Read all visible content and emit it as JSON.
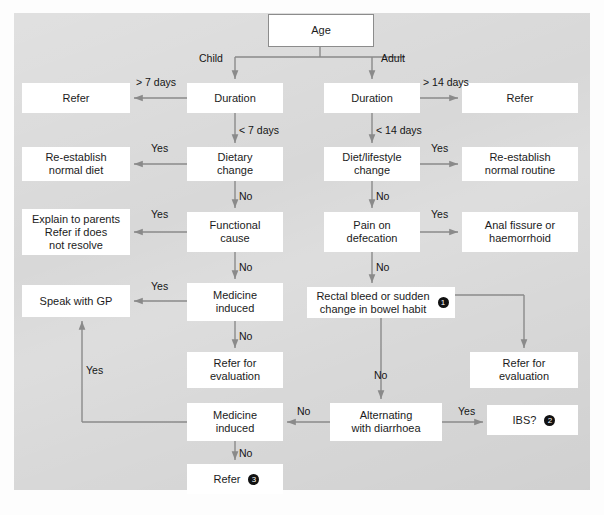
{
  "figure": {
    "type": "clinical-decision-flowchart",
    "panel": {
      "x": 14,
      "y": 13,
      "w": 576,
      "h": 477,
      "bg": "#d8d8d8"
    },
    "caption": "",
    "colors": {
      "box_fill": "#ffffff",
      "box_border": "#8c8c8c",
      "arrow": "#8a8a8a",
      "text": "#1b1b1b",
      "panel_bg": "#d8d8d8"
    }
  },
  "nodes": [
    {
      "id": "age",
      "label": "Age",
      "x": 268,
      "y": 14,
      "w": 104,
      "h": 31,
      "bordered": true,
      "marker": null
    },
    {
      "id": "refer_child",
      "label": "Refer",
      "x": 22,
      "y": 83,
      "w": 108,
      "h": 30,
      "bordered": false,
      "marker": null
    },
    {
      "id": "duration_child",
      "label": "Duration",
      "x": 187,
      "y": 83,
      "w": 96,
      "h": 30,
      "bordered": false,
      "marker": null
    },
    {
      "id": "duration_adult",
      "label": "Duration",
      "x": 324,
      "y": 83,
      "w": 96,
      "h": 30,
      "bordered": false,
      "marker": null
    },
    {
      "id": "refer_adult",
      "label": "Refer",
      "x": 462,
      "y": 83,
      "w": 116,
      "h": 30,
      "bordered": false,
      "marker": null
    },
    {
      "id": "reestablish_diet",
      "label": "Re-establish\nnormal diet",
      "x": 22,
      "y": 147,
      "w": 108,
      "h": 34,
      "bordered": false,
      "marker": null
    },
    {
      "id": "dietary_change",
      "label": "Dietary\nchange",
      "x": 187,
      "y": 147,
      "w": 96,
      "h": 34,
      "bordered": false,
      "marker": null
    },
    {
      "id": "diet_lifestyle",
      "label": "Diet/lifestyle\nchange",
      "x": 324,
      "y": 147,
      "w": 96,
      "h": 34,
      "bordered": false,
      "marker": null
    },
    {
      "id": "reestablish_routine",
      "label": "Re-establish\nnormal routine",
      "x": 462,
      "y": 147,
      "w": 116,
      "h": 34,
      "bordered": false,
      "marker": null
    },
    {
      "id": "explain_parents",
      "label": "Explain to parents\nRefer if does\nnot resolve",
      "x": 22,
      "y": 209,
      "w": 108,
      "h": 46,
      "bordered": false,
      "marker": null
    },
    {
      "id": "functional_cause",
      "label": "Functional\ncause",
      "x": 187,
      "y": 212,
      "w": 96,
      "h": 40,
      "bordered": false,
      "marker": null
    },
    {
      "id": "pain_defecation",
      "label": "Pain on\ndefecation",
      "x": 324,
      "y": 212,
      "w": 96,
      "h": 40,
      "bordered": false,
      "marker": null
    },
    {
      "id": "anal_fissure",
      "label": "Anal fissure or\nhaemorrhoid",
      "x": 462,
      "y": 212,
      "w": 116,
      "h": 40,
      "bordered": false,
      "marker": null
    },
    {
      "id": "speak_gp",
      "label": "Speak with GP",
      "x": 22,
      "y": 285,
      "w": 108,
      "h": 32,
      "bordered": false,
      "marker": null
    },
    {
      "id": "medicine_induced_1",
      "label": "Medicine\ninduced",
      "x": 187,
      "y": 283,
      "w": 96,
      "h": 38,
      "bordered": false,
      "marker": null
    },
    {
      "id": "rectal_bleed",
      "label": "Rectal bleed or sudden\nchange in bowel habit",
      "x": 307,
      "y": 287,
      "w": 148,
      "h": 31,
      "bordered": false,
      "marker": "1"
    },
    {
      "id": "refer_eval_left",
      "label": "Refer for\nevaluation",
      "x": 187,
      "y": 352,
      "w": 96,
      "h": 36,
      "bordered": false,
      "marker": null
    },
    {
      "id": "refer_eval_right",
      "label": "Refer for\nevaluation",
      "x": 470,
      "y": 352,
      "w": 108,
      "h": 36,
      "bordered": false,
      "marker": null
    },
    {
      "id": "medicine_induced_2",
      "label": "Medicine\ninduced",
      "x": 187,
      "y": 403,
      "w": 96,
      "h": 38,
      "bordered": false,
      "marker": null
    },
    {
      "id": "alternating_diarrhoea",
      "label": "Alternating\nwith diarrhoea",
      "x": 330,
      "y": 403,
      "w": 112,
      "h": 38,
      "bordered": false,
      "marker": null
    },
    {
      "id": "ibs",
      "label": "IBS?",
      "x": 487,
      "y": 405,
      "w": 91,
      "h": 30,
      "bordered": false,
      "marker": "2"
    },
    {
      "id": "refer_final",
      "label": "Refer",
      "x": 187,
      "y": 464,
      "w": 96,
      "h": 30,
      "bordered": false,
      "marker": "3"
    }
  ],
  "edge_labels": [
    {
      "id": "child",
      "text": "Child",
      "x": 199,
      "y": 52
    },
    {
      "id": "adult",
      "text": "Adult",
      "x": 381,
      "y": 52
    },
    {
      "id": "gt7days",
      "text": "> 7 days",
      "x": 136,
      "y": 76
    },
    {
      "id": "lt7days",
      "text": "< 7 days",
      "x": 239,
      "y": 124
    },
    {
      "id": "gt14days",
      "text": "> 14 days",
      "x": 423,
      "y": 76
    },
    {
      "id": "lt14days",
      "text": "< 14 days",
      "x": 376,
      "y": 124
    },
    {
      "id": "yes_diet_child",
      "text": "Yes",
      "x": 151,
      "y": 142
    },
    {
      "id": "no_diet_child",
      "text": "No",
      "x": 239,
      "y": 190
    },
    {
      "id": "yes_diet_adult",
      "text": "Yes",
      "x": 431,
      "y": 142
    },
    {
      "id": "no_diet_adult",
      "text": "No",
      "x": 376,
      "y": 190
    },
    {
      "id": "yes_functional",
      "text": "Yes",
      "x": 151,
      "y": 208
    },
    {
      "id": "no_functional",
      "text": "No",
      "x": 239,
      "y": 261
    },
    {
      "id": "yes_pain",
      "text": "Yes",
      "x": 431,
      "y": 208
    },
    {
      "id": "no_pain",
      "text": "No",
      "x": 376,
      "y": 261
    },
    {
      "id": "yes_medicine1",
      "text": "Yes",
      "x": 151,
      "y": 280
    },
    {
      "id": "no_medicine1",
      "text": "No",
      "x": 239,
      "y": 330
    },
    {
      "id": "no_rectal",
      "text": "No",
      "x": 374,
      "y": 369
    },
    {
      "id": "yes_long",
      "text": "Yes",
      "x": 86,
      "y": 364
    },
    {
      "id": "no_alternating",
      "text": "No",
      "x": 297,
      "y": 405
    },
    {
      "id": "yes_alternating",
      "text": "Yes",
      "x": 458,
      "y": 405
    },
    {
      "id": "no_medicine2",
      "text": "No",
      "x": 239,
      "y": 447
    }
  ],
  "edges": [
    {
      "from": "age",
      "to": "duration_child",
      "label": "Child"
    },
    {
      "from": "age",
      "to": "duration_adult",
      "label": "Adult"
    },
    {
      "from": "duration_child",
      "to": "refer_child",
      "label": "> 7 days"
    },
    {
      "from": "duration_child",
      "to": "dietary_change",
      "label": "< 7 days"
    },
    {
      "from": "duration_adult",
      "to": "refer_adult",
      "label": "> 14 days"
    },
    {
      "from": "duration_adult",
      "to": "diet_lifestyle",
      "label": "< 14 days"
    },
    {
      "from": "dietary_change",
      "to": "reestablish_diet",
      "label": "Yes"
    },
    {
      "from": "dietary_change",
      "to": "functional_cause",
      "label": "No"
    },
    {
      "from": "diet_lifestyle",
      "to": "reestablish_routine",
      "label": "Yes"
    },
    {
      "from": "diet_lifestyle",
      "to": "pain_defecation",
      "label": "No"
    },
    {
      "from": "functional_cause",
      "to": "explain_parents",
      "label": "Yes"
    },
    {
      "from": "functional_cause",
      "to": "medicine_induced_1",
      "label": "No"
    },
    {
      "from": "pain_defecation",
      "to": "anal_fissure",
      "label": "Yes"
    },
    {
      "from": "pain_defecation",
      "to": "rectal_bleed",
      "label": "No"
    },
    {
      "from": "medicine_induced_1",
      "to": "speak_gp",
      "label": "Yes"
    },
    {
      "from": "medicine_induced_1",
      "to": "refer_eval_left",
      "label": "No"
    },
    {
      "from": "rectal_bleed",
      "to": "refer_eval_right",
      "label": "Yes"
    },
    {
      "from": "rectal_bleed",
      "to": "alternating_diarrhoea",
      "label": "No"
    },
    {
      "from": "alternating_diarrhoea",
      "to": "medicine_induced_2",
      "label": "No"
    },
    {
      "from": "alternating_diarrhoea",
      "to": "ibs",
      "label": "Yes"
    },
    {
      "from": "medicine_induced_2",
      "to": "speak_gp",
      "label": "Yes"
    },
    {
      "from": "medicine_induced_2",
      "to": "refer_final",
      "label": "No"
    }
  ],
  "paths": [
    {
      "id": "age-stem",
      "d": "M320,45 L320,57"
    },
    {
      "id": "age-split",
      "d": "M235,57 L405,57"
    },
    {
      "id": "to-duration-child",
      "d": "M235,57 L235,79"
    },
    {
      "id": "to-duration-adult",
      "d": "M372,57 L372,79"
    },
    {
      "id": "dur-child-to-refer",
      "d": "M187,98 L134,98"
    },
    {
      "id": "dur-child-down",
      "d": "M235,113 L235,143"
    },
    {
      "id": "dur-adult-to-refer",
      "d": "M420,98 L458,98"
    },
    {
      "id": "dur-adult-down",
      "d": "M372,113 L372,143"
    },
    {
      "id": "diet-child-left",
      "d": "M187,164 L134,164"
    },
    {
      "id": "diet-child-down",
      "d": "M235,181 L235,208"
    },
    {
      "id": "diet-adult-right",
      "d": "M420,164 L458,164"
    },
    {
      "id": "diet-adult-down",
      "d": "M372,181 L372,208"
    },
    {
      "id": "func-left",
      "d": "M187,232 L134,232"
    },
    {
      "id": "func-down",
      "d": "M235,252 L235,279"
    },
    {
      "id": "pain-right",
      "d": "M420,232 L458,232"
    },
    {
      "id": "pain-down",
      "d": "M372,252 L372,283"
    },
    {
      "id": "med1-left",
      "d": "M187,301 L134,301"
    },
    {
      "id": "med1-down",
      "d": "M235,321 L235,348"
    },
    {
      "id": "rectal-right-h",
      "d": "M455,295 L524,295"
    },
    {
      "id": "rectal-right-v",
      "d": "M524,295 L524,348"
    },
    {
      "id": "rectal-down",
      "d": "M381,318 L381,399"
    },
    {
      "id": "alt-left",
      "d": "M330,422 L287,422"
    },
    {
      "id": "alt-right",
      "d": "M442,422 L483,422"
    },
    {
      "id": "med2-down",
      "d": "M235,441 L235,460"
    },
    {
      "id": "med2-yes-h",
      "d": "M187,422 L82,422"
    },
    {
      "id": "med2-yes-v",
      "d": "M82,422 L82,321"
    }
  ]
}
